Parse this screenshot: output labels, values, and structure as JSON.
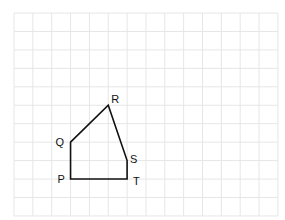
{
  "diagram": {
    "type": "polygon-on-grid",
    "grid": {
      "origin_px": [
        14,
        13
      ],
      "cell_w": 18.85,
      "cell_h": 18.45,
      "cols": 14,
      "rows": 11,
      "line_color": "#e6e6e6"
    },
    "shape": {
      "stroke": "#111111",
      "stroke_width": 1.6,
      "vertices": [
        {
          "label": "P",
          "gx": 3,
          "gy": 9,
          "label_dx": -13,
          "label_dy": 4
        },
        {
          "label": "Q",
          "gx": 3,
          "gy": 7,
          "label_dx": -15,
          "label_dy": 4
        },
        {
          "label": "R",
          "gx": 5,
          "gy": 5,
          "label_dx": 3,
          "label_dy": -2
        },
        {
          "label": "S",
          "gx": 6,
          "gy": 8,
          "label_dx": 3,
          "label_dy": 2
        },
        {
          "label": "T",
          "gx": 6,
          "gy": 9,
          "label_dx": 6,
          "label_dy": 6
        }
      ]
    }
  }
}
